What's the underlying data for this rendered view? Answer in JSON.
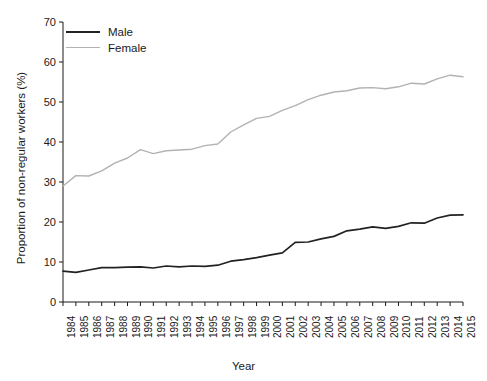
{
  "chart_data": {
    "type": "line",
    "title": "",
    "xlabel": "Year",
    "ylabel": "Proportion of non-regular workers (%)",
    "xlim": [
      1984,
      2015
    ],
    "ylim": [
      0,
      70
    ],
    "yticks": [
      0,
      10,
      20,
      30,
      40,
      50,
      60,
      70
    ],
    "grid": false,
    "legend_position": "top-left",
    "x": [
      1984,
      1985,
      1986,
      1987,
      1988,
      1989,
      1990,
      1991,
      1992,
      1993,
      1994,
      1995,
      1996,
      1997,
      1998,
      1999,
      2000,
      2001,
      2002,
      2003,
      2004,
      2005,
      2006,
      2007,
      2008,
      2009,
      2010,
      2011,
      2012,
      2013,
      2014,
      2015
    ],
    "categories": [
      "1984",
      "1985",
      "1986",
      "1987",
      "1988",
      "1989",
      "1990",
      "1991",
      "1992",
      "1993",
      "1994",
      "1995",
      "1996",
      "1997",
      "1998",
      "1999",
      "2000",
      "2001",
      "2002",
      "2003",
      "2004",
      "2005",
      "2006",
      "2007",
      "2008",
      "2009",
      "2010",
      "2011",
      "2012",
      "2013",
      "2014",
      "2015"
    ],
    "series": [
      {
        "name": "Male",
        "color": "#222222",
        "values": [
          7.7,
          7.4,
          8.0,
          8.6,
          8.6,
          8.7,
          8.8,
          8.5,
          9.0,
          8.8,
          9.0,
          8.9,
          9.2,
          10.2,
          10.6,
          11.1,
          11.7,
          12.3,
          14.9,
          15.0,
          15.8,
          16.4,
          17.8,
          18.2,
          18.8,
          18.4,
          18.9,
          19.8,
          19.7,
          21.0,
          21.7,
          21.8
        ]
      },
      {
        "name": "Female",
        "color": "#b2b2b2",
        "values": [
          29.0,
          31.6,
          31.5,
          32.8,
          34.7,
          36.0,
          38.1,
          37.1,
          37.8,
          38.0,
          38.2,
          39.1,
          39.5,
          42.5,
          44.3,
          45.9,
          46.4,
          47.9,
          49.1,
          50.6,
          51.7,
          52.5,
          52.8,
          53.5,
          53.6,
          53.3,
          53.8,
          54.7,
          54.5,
          55.8,
          56.7,
          56.3
        ]
      }
    ]
  },
  "legend": {
    "items": [
      {
        "label": "Male",
        "color": "#222222"
      },
      {
        "label": "Female",
        "color": "#b2b2b2"
      }
    ]
  },
  "axes": {
    "y_title": "Proportion of non-regular workers (%)",
    "x_title": "Year",
    "y_tick_labels": [
      "70",
      "60",
      "50",
      "40",
      "30",
      "20",
      "10",
      "0"
    ],
    "x_tick_labels": [
      "1984",
      "1985",
      "1986",
      "1987",
      "1988",
      "1989",
      "1990",
      "1991",
      "1992",
      "1993",
      "1994",
      "1995",
      "1996",
      "1997",
      "1998",
      "1999",
      "2000",
      "2001",
      "2002",
      "2003",
      "2004",
      "2005",
      "2006",
      "2007",
      "2008",
      "2009",
      "2010",
      "2011",
      "2012",
      "2013",
      "2014",
      "2015"
    ]
  }
}
